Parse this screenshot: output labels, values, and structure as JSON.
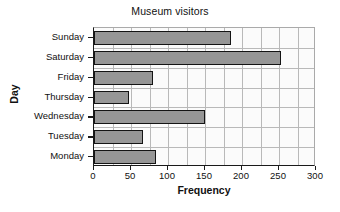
{
  "chart_data": {
    "type": "bar",
    "orientation": "horizontal",
    "title": "Museum visitors",
    "xlabel": "Frequency",
    "ylabel": "Day",
    "categories": [
      "Monday",
      "Tuesday",
      "Wednesday",
      "Thursday",
      "Friday",
      "Saturday",
      "Sunday"
    ],
    "values": [
      84,
      66,
      150,
      47,
      80,
      253,
      185
    ],
    "series": [
      {
        "name": "Frequency",
        "values": [
          84,
          66,
          150,
          47,
          80,
          253,
          185
        ]
      }
    ],
    "xlim": [
      0,
      300
    ],
    "xticks": [
      0,
      50,
      100,
      150,
      200,
      250,
      300
    ],
    "xtick_labels": [
      "0",
      "50",
      "100",
      "150",
      "200",
      "250",
      "300"
    ],
    "minor_gridline_step": 25,
    "grid": true,
    "legend": false,
    "bar_fill_color": "#969696",
    "bar_edge_color": "#141414",
    "grid_color": "#b9b9b9",
    "plot_background": "#fbfbfb",
    "axis_color": "#1a1a1a"
  }
}
